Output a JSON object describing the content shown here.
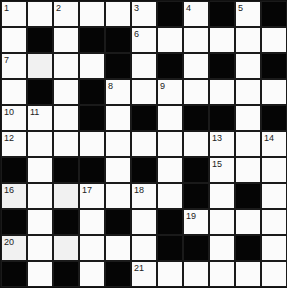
{
  "puzzle": {
    "rows": 11,
    "cols": 11,
    "layout": [
      "WWWWWWBWBWB",
      "WBWBBWWWWWW",
      "WWWWBWBWBWB",
      "WBWBWWWWWWW",
      "WWWBWBWBBWB",
      "WWWWWWWWWWW",
      "BWBBWBWBWWW",
      "WWWWWWWBWBW",
      "BWBWBWBWWWW",
      "WWWWWWBBWBW",
      "BWBWBWWWWWW"
    ],
    "numbers": [
      {
        "row": 0,
        "col": 0,
        "n": "1"
      },
      {
        "row": 0,
        "col": 2,
        "n": "2"
      },
      {
        "row": 0,
        "col": 5,
        "n": "3"
      },
      {
        "row": 0,
        "col": 7,
        "n": "4"
      },
      {
        "row": 0,
        "col": 9,
        "n": "5"
      },
      {
        "row": 1,
        "col": 5,
        "n": "6"
      },
      {
        "row": 2,
        "col": 0,
        "n": "7"
      },
      {
        "row": 3,
        "col": 4,
        "n": "8"
      },
      {
        "row": 3,
        "col": 6,
        "n": "9"
      },
      {
        "row": 4,
        "col": 0,
        "n": "10"
      },
      {
        "row": 4,
        "col": 1,
        "n": "11"
      },
      {
        "row": 5,
        "col": 0,
        "n": "12"
      },
      {
        "row": 5,
        "col": 8,
        "n": "13"
      },
      {
        "row": 5,
        "col": 10,
        "n": "14"
      },
      {
        "row": 6,
        "col": 8,
        "n": "15"
      },
      {
        "row": 7,
        "col": 0,
        "n": "16"
      },
      {
        "row": 7,
        "col": 3,
        "n": "17"
      },
      {
        "row": 7,
        "col": 5,
        "n": "18"
      },
      {
        "row": 8,
        "col": 7,
        "n": "19"
      },
      {
        "row": 9,
        "col": 0,
        "n": "20"
      },
      {
        "row": 10,
        "col": 5,
        "n": "21"
      }
    ],
    "shaded_cells": [
      {
        "row": 2,
        "col": 1
      },
      {
        "row": 7,
        "col": 2
      },
      {
        "row": 9,
        "col": 2
      },
      {
        "row": 9,
        "col": 0
      },
      {
        "row": 7,
        "col": 0
      }
    ],
    "colors": {
      "black_cell": "#050505",
      "white_cell": "#fbfbfb",
      "grid_line": "#1a1a1a"
    }
  }
}
